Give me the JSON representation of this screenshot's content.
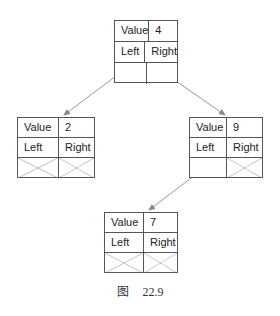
{
  "figure": {
    "caption_prefix": "图",
    "caption_number": "22.9"
  },
  "nodes": [
    {
      "id": "n4",
      "value_label": "Value",
      "value": "4",
      "left_label": "Left",
      "right_label": "Right",
      "left_child": "n2",
      "right_child": "n9"
    },
    {
      "id": "n2",
      "value_label": "Value",
      "value": "2",
      "left_label": "Left",
      "right_label": "Right",
      "left_child": null,
      "right_child": null
    },
    {
      "id": "n9",
      "value_label": "Value",
      "value": "9",
      "left_label": "Left",
      "right_label": "Right",
      "left_child": "n7",
      "right_child": null
    },
    {
      "id": "n7",
      "value_label": "Value",
      "value": "7",
      "left_label": "Left",
      "right_label": "Right",
      "left_child": null,
      "right_child": null
    }
  ],
  "colors": {
    "border": "#555555",
    "edge": "#999999",
    "text": "#222222"
  }
}
